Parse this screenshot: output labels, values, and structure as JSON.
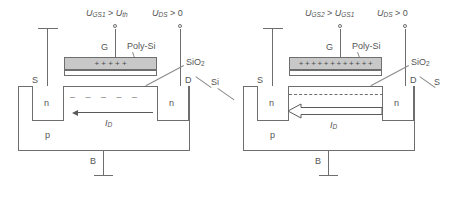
{
  "diagram": {
    "colors": {
      "line": "#6e6e6e",
      "text": "#555555",
      "poly_fill": "#c8c8c8",
      "background": "#ffffff"
    }
  },
  "devices": [
    {
      "id": "left",
      "gate_voltage_label": {
        "sym": "U",
        "sub": "GS1",
        "rel": ">",
        "ref_sym": "U",
        "ref_sub": "th"
      },
      "drain_voltage_label": {
        "sym": "U",
        "sub": "DS",
        "rel": ">",
        "ref": "0"
      },
      "gate_terminal": "G",
      "source_terminal": "S",
      "drain_terminal": "D",
      "bulk_terminal": "B",
      "poly_label": "Poly-Si",
      "oxide_label": "SiO",
      "oxide_sub": "2",
      "substrate_label": "p",
      "source_well_label": "n",
      "drain_well_label": "n",
      "current_label": {
        "sym": "I",
        "sub": "D"
      },
      "gate_charges": "+  +  +  +  +",
      "charge_count": 5,
      "channel_style": "sparse-dashed",
      "channel_charges": "–   –   –   –   –",
      "arrow_style": "thin"
    },
    {
      "id": "right",
      "gate_voltage_label": {
        "sym": "U",
        "sub": "GS2",
        "rel": ">",
        "ref_sym": "U",
        "ref_sub": "GS1"
      },
      "drain_voltage_label": {
        "sym": "U",
        "sub": "DS",
        "rel": ">",
        "ref": "0"
      },
      "gate_terminal": "G",
      "source_terminal": "S",
      "drain_terminal": "D",
      "bulk_terminal": "B",
      "poly_label": "Poly-Si",
      "oxide_label": "SiO",
      "oxide_sub": "2",
      "substrate_label": "p",
      "source_well_label": "n",
      "drain_well_label": "n",
      "current_label": {
        "sym": "I",
        "sub": "D"
      },
      "gate_charges": "+ + + + + + + + + + + +",
      "charge_count": 12,
      "channel_style": "continuous-dashed",
      "channel_charges": "",
      "arrow_style": "block"
    }
  ],
  "shared_labels": {
    "silicon_center": "Si",
    "silicon_right": "S"
  }
}
